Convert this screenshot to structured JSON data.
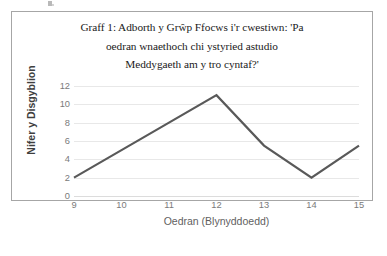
{
  "chart_data": {
    "type": "line",
    "title": "Graff 1: Adborth y Grŵp Ffocws i'r cwestiwn: 'Pa oedran wnaethoch chi ystyried astudio Meddygaeth am y tro cyntaf?'",
    "title_lines": [
      "Graff 1: Adborth y Grŵp Ffocws i'r cwestiwn: 'Pa",
      "oedran wnaethoch chi ystyried astudio",
      "Meddygaeth am y tro cyntaf?'"
    ],
    "xlabel": "Oedran (Blynyddoedd)",
    "ylabel": "Nifer y Disgyblion",
    "x": [
      9,
      10,
      11,
      12,
      13,
      14,
      15
    ],
    "xtick_labels": [
      "9",
      "10",
      "11",
      "12",
      "13",
      "14",
      "15"
    ],
    "values": [
      2,
      5,
      8,
      11,
      5.5,
      2,
      5.5
    ],
    "ytick_labels": [
      "12",
      "10",
      "8",
      "6",
      "4",
      "2",
      "0"
    ],
    "yticks": [
      12,
      10,
      8,
      6,
      4,
      2,
      0
    ],
    "ylim": [
      0,
      12
    ],
    "xlim": [
      9,
      15
    ],
    "grid": "horizontal",
    "legend": "none",
    "series_color": "#595959",
    "grid_color": "#e8e8e8",
    "tick_text_color": "#7a7a7a",
    "axis_title_color": "#5f5f5f",
    "frame_border_color": "#a6a6a6",
    "background": "#ffffff"
  }
}
